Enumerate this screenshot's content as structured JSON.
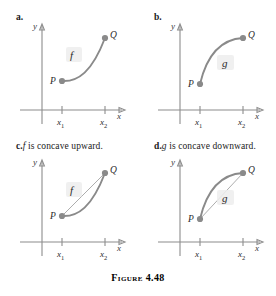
{
  "figure": {
    "caption_prefix": "Figure",
    "caption_number": "4.48",
    "caption_full": "FIGURE 4.48"
  },
  "panels": [
    {
      "id": "a",
      "label": "a.",
      "caption": "",
      "function_label": "f",
      "axis_x_label": "x",
      "axis_y_label": "y",
      "point_p_label": "P",
      "point_q_label": "Q",
      "tick_labels": [
        "x",
        "x"
      ],
      "tick_subscripts": [
        "1",
        "2"
      ],
      "concavity": "upward",
      "has_chord": false
    },
    {
      "id": "b",
      "label": "b.",
      "caption": "",
      "function_label": "g",
      "axis_x_label": "x",
      "axis_y_label": "y",
      "point_p_label": "P",
      "point_q_label": "Q",
      "tick_labels": [
        "x",
        "x"
      ],
      "tick_subscripts": [
        "1",
        "2"
      ],
      "concavity": "downward",
      "has_chord": false
    },
    {
      "id": "c",
      "label": "c.",
      "caption_function": "f",
      "caption_text": " is concave upward.",
      "function_label": "f",
      "axis_x_label": "x",
      "axis_y_label": "y",
      "point_p_label": "P",
      "point_q_label": "Q",
      "tick_labels": [
        "x",
        "x"
      ],
      "tick_subscripts": [
        "1",
        "2"
      ],
      "concavity": "upward",
      "has_chord": true
    },
    {
      "id": "d",
      "label": "d.",
      "caption_function": "g",
      "caption_text": " is concave downward.",
      "function_label": "g",
      "axis_x_label": "x",
      "axis_y_label": "y",
      "point_p_label": "P",
      "point_q_label": "Q",
      "tick_labels": [
        "x",
        "x"
      ],
      "tick_subscripts": [
        "1",
        "2"
      ],
      "concavity": "downward",
      "has_chord": true
    }
  ],
  "colors": {
    "curve": "#8a8a8a",
    "axis": "#8c8c8c",
    "text": "#1a1a1a",
    "label_box": "#ededed"
  }
}
